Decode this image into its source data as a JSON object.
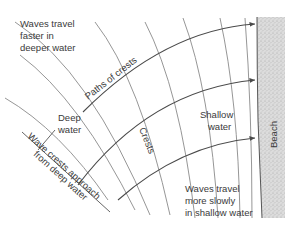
{
  "diagram": {
    "type": "wave-refraction",
    "labels": {
      "faster_line1": "Waves travel",
      "faster_line2": "faster in",
      "faster_line3": "deeper water",
      "paths_of_crests": "Paths of crests",
      "deep_line1": "Deep",
      "deep_line2": "water",
      "crests": "Crests",
      "shallow_line1": "Shallow",
      "shallow_line2": "water",
      "approach_line1": "Wave crests approach",
      "approach_line2": "from deep water",
      "slower_line1": "Waves travel",
      "slower_line2": "more slowly",
      "slower_line3": "in shallow water",
      "beach": "Beach"
    },
    "colors": {
      "line": "#4a4a4a",
      "crest": "#8a8a8a",
      "text": "#3a3a3a",
      "beach_fill": "#cfcfcf"
    },
    "elements": {
      "crest_count": 10,
      "path_count": 3
    }
  }
}
